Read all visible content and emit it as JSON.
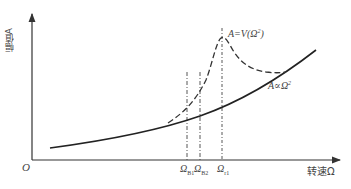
{
  "diagram": {
    "y_axis_label": "幅值A",
    "x_axis_label": "转速Ω",
    "origin_label": "O",
    "ticks": [
      {
        "symbol": "Ω",
        "sub": "B1",
        "x": 187
      },
      {
        "symbol": "Ω",
        "sub": "B2",
        "x": 200
      },
      {
        "symbol": "Ω",
        "sub": "r1",
        "x": 222
      }
    ],
    "annotations": {
      "resonance_curve": {
        "base": "A=V(Ω",
        "sup": "2",
        "tail": ")"
      },
      "square_curve": {
        "base": "A∝Ω",
        "sup": "2"
      }
    },
    "curves": [
      {
        "name": "A proportional to Omega squared",
        "style": "solid"
      },
      {
        "name": "A = V(Omega^2) resonance",
        "style": "dashed"
      }
    ],
    "vertical_markers_style": "dash-dot",
    "colors": {
      "line": "#333333",
      "background": "#ffffff"
    }
  }
}
